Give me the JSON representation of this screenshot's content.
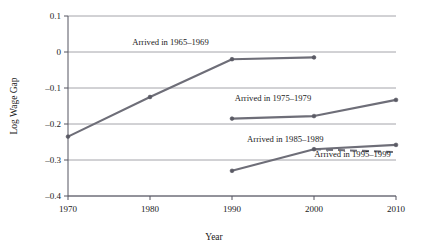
{
  "chart_data": {
    "type": "line",
    "title": "",
    "xlabel": "Year",
    "ylabel": "Log Wage Gap",
    "xlim": [
      1970,
      2010
    ],
    "ylim": [
      -0.4,
      0.1
    ],
    "xticks": [
      "1970",
      "1980",
      "1990",
      "2000",
      "2010"
    ],
    "yticks": [
      "0.1",
      "0",
      "–0.1",
      "–0.2",
      "–0.3",
      "–0.4"
    ],
    "ytick_values": [
      0.1,
      0,
      -0.1,
      -0.2,
      -0.3,
      -0.4
    ],
    "xtick_values": [
      1970,
      1980,
      1990,
      2000,
      2010
    ],
    "grid": "horizontal",
    "legend": "inline-annotations",
    "line_color": "#6e6e78",
    "marker_color": "#5a5a64",
    "series": [
      {
        "name": "Arrived in 1965–1969",
        "style": "solid",
        "x": [
          1970,
          1980,
          1990,
          2000
        ],
        "values": [
          -0.235,
          -0.125,
          -0.02,
          -0.015
        ],
        "label_x": 1982.5,
        "label_y": 0.028,
        "label_anchor": "middle"
      },
      {
        "name": "Arrived in 1975–1979",
        "style": "solid",
        "x": [
          1990,
          2000,
          2010
        ],
        "values": [
          -0.185,
          -0.178,
          -0.133
        ],
        "label_x": 1995.0,
        "label_y": -0.128,
        "label_anchor": "middle"
      },
      {
        "name": "Arrived in 1985–1989",
        "style": "solid",
        "x": [
          1990,
          2000,
          2010
        ],
        "values": [
          -0.33,
          -0.27,
          -0.258
        ],
        "label_x": 1996.5,
        "label_y": -0.243,
        "label_anchor": "middle"
      },
      {
        "name": "Arrived in 1995–1999",
        "style": "dashed",
        "x": [
          2000,
          2010
        ],
        "values": [
          -0.27,
          -0.278
        ],
        "label_x": 2004.7,
        "label_y": -0.284,
        "label_anchor": "middle"
      }
    ]
  }
}
